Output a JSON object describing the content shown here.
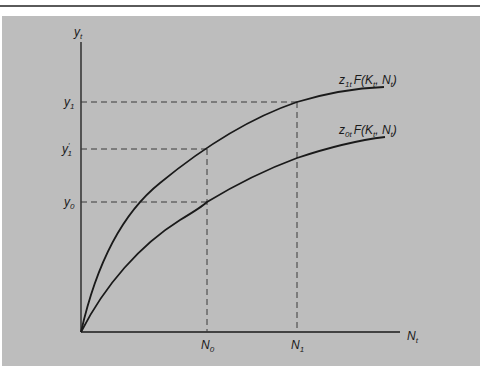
{
  "diagram": {
    "type": "production-function-shift",
    "axes": {
      "y_label": {
        "main": "y",
        "sub": "t"
      },
      "x_label": {
        "main": "N",
        "sub": "t"
      }
    },
    "y_ticks": [
      {
        "id": "y1",
        "main": "y",
        "sub": "1",
        "prime": false
      },
      {
        "id": "y1prime",
        "main": "y",
        "sub": "1",
        "prime": true
      },
      {
        "id": "y0",
        "main": "y",
        "sub": "0",
        "prime": false
      }
    ],
    "x_ticks": [
      {
        "id": "N0",
        "main": "N",
        "sub": "0"
      },
      {
        "id": "N1",
        "main": "N",
        "sub": "1"
      }
    ],
    "curves": [
      {
        "id": "upper",
        "label": {
          "z": "z",
          "zsub": "1t",
          "func": "F(K",
          "k_sub": "t",
          "sep": ", N",
          "n_sub": "t",
          "close": ")"
        }
      },
      {
        "id": "lower",
        "label": {
          "z": "z",
          "zsub": "0t",
          "func": "F(K",
          "k_sub": "t",
          "sep": ", N",
          "n_sub": "t",
          "close": ")"
        }
      }
    ],
    "colors": {
      "panel": "#bdbdbd",
      "ink": "#1a1a1a",
      "dash": "#3a3a3a"
    }
  }
}
